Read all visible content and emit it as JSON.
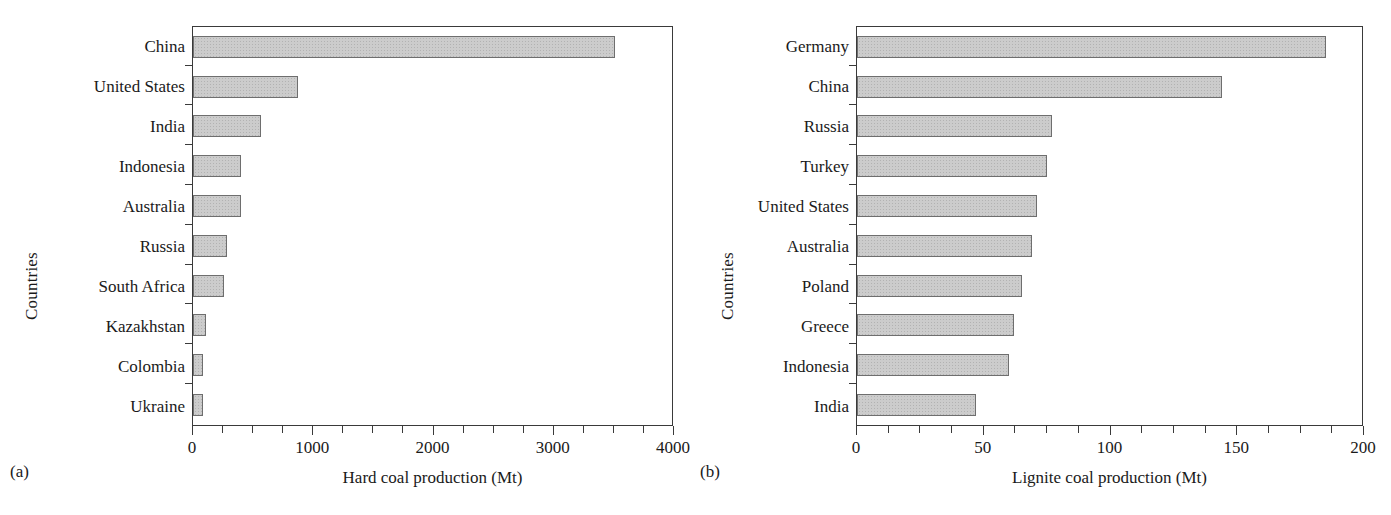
{
  "figure": {
    "background": "#ffffff",
    "bar_fill": "#cccccc",
    "bar_stroke": "#6e6e6e",
    "axis_color": "#3a3a3a"
  },
  "panels": [
    {
      "tag": "(a)",
      "ylabel": "Countries",
      "xlabel": "Hard coal production (Mt)"
    },
    {
      "tag": "(b)",
      "ylabel": "Countries",
      "xlabel": "Lignite coal production (Mt)"
    }
  ],
  "chart_data": [
    {
      "type": "bar",
      "orientation": "horizontal",
      "title": "",
      "panel": "(a)",
      "xlabel": "Hard coal production (Mt)",
      "ylabel": "Countries",
      "xlim": [
        0,
        4000
      ],
      "xticks": [
        0,
        1000,
        2000,
        3000,
        4000
      ],
      "xticklabels": [
        "0",
        "1000",
        "2000",
        "3000",
        "4000"
      ],
      "minor_tick_step": 250,
      "grid": false,
      "legend": "none",
      "categories": [
        "China",
        "United States",
        "India",
        "Indonesia",
        "Australia",
        "Russia",
        "South Africa",
        "Kazakhstan",
        "Colombia",
        "Ukraine"
      ],
      "values": [
        3510,
        875,
        565,
        400,
        400,
        285,
        260,
        110,
        85,
        85
      ]
    },
    {
      "type": "bar",
      "orientation": "horizontal",
      "title": "",
      "panel": "(b)",
      "xlabel": "Lignite coal production (Mt)",
      "ylabel": "Countries",
      "xlim": [
        0,
        200
      ],
      "xticks": [
        0,
        50,
        100,
        150,
        200
      ],
      "xticklabels": [
        "0",
        "50",
        "100",
        "150",
        "200"
      ],
      "minor_tick_step": 12.5,
      "grid": false,
      "legend": "none",
      "categories": [
        "Germany",
        "China",
        "Russia",
        "Turkey",
        "United States",
        "Australia",
        "Poland",
        "Greece",
        "Indonesia",
        "India"
      ],
      "values": [
        185,
        144,
        77,
        75,
        71,
        69,
        65,
        62,
        60,
        47
      ]
    }
  ]
}
